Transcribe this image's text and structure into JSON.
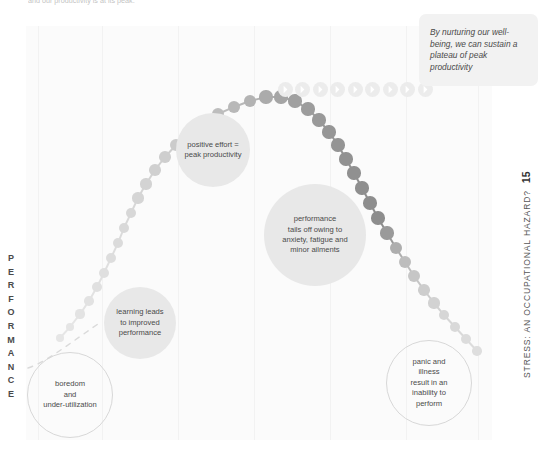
{
  "top_caption": "and our productivity is at its peak.",
  "axis": {
    "y_label": "PERFORMANCE"
  },
  "running_head": {
    "title": "STRESS: AN OCCUPATIONAL HAZARD?",
    "page_number": "15"
  },
  "callout": {
    "text": "By nurturing our well-being, we can sustain a plateau of peak productivity"
  },
  "bubbles": [
    {
      "id": "boredom",
      "lines": [
        "boredom",
        "and",
        "under-utilization"
      ],
      "style": "outlined",
      "left": 27,
      "top": 352,
      "size": 86
    },
    {
      "id": "learning",
      "lines": [
        "learning leads",
        "to improved",
        "performance"
      ],
      "style": "filled",
      "left": 104,
      "top": 287,
      "size": 72
    },
    {
      "id": "peak",
      "lines": [
        "positive effort =",
        "peak productivity"
      ],
      "style": "filled",
      "left": 176,
      "top": 113,
      "size": 74
    },
    {
      "id": "tails-off",
      "lines": [
        "performance",
        "tails off owing to",
        "anxiety, fatigue and",
        "minor ailments"
      ],
      "style": "filled",
      "left": 264,
      "top": 184,
      "size": 102
    },
    {
      "id": "panic",
      "lines": [
        "panic and",
        "illness",
        "result in an",
        "inability to",
        "perform"
      ],
      "style": "outlined",
      "left": 386,
      "top": 340,
      "size": 86
    }
  ],
  "chart_data": {
    "type": "scatter",
    "xlabel": "",
    "ylabel": "PERFORMANCE",
    "grid": false,
    "legend": null,
    "series": [
      {
        "name": "performance-curve",
        "points": [
          {
            "x": 60,
            "y": 338,
            "r": 4.0,
            "c": "#e6e6e6"
          },
          {
            "x": 70,
            "y": 327,
            "r": 4.4,
            "c": "#e5e5e5"
          },
          {
            "x": 80,
            "y": 314,
            "r": 4.6,
            "c": "#e3e3e3"
          },
          {
            "x": 89,
            "y": 301,
            "r": 4.8,
            "c": "#e2e2e2"
          },
          {
            "x": 97,
            "y": 287,
            "r": 5.0,
            "c": "#e0e0e0"
          },
          {
            "x": 104,
            "y": 273,
            "r": 5.0,
            "c": "#dfdfdf"
          },
          {
            "x": 111,
            "y": 258,
            "r": 5.2,
            "c": "#dddddd"
          },
          {
            "x": 118,
            "y": 243,
            "r": 5.2,
            "c": "#dbdbdb"
          },
          {
            "x": 124,
            "y": 228,
            "r": 5.4,
            "c": "#d9d9d9"
          },
          {
            "x": 131,
            "y": 213,
            "r": 5.4,
            "c": "#d7d7d7"
          },
          {
            "x": 138,
            "y": 198,
            "r": 5.6,
            "c": "#d5d5d5"
          },
          {
            "x": 146,
            "y": 184,
            "r": 5.6,
            "c": "#d3d3d3"
          },
          {
            "x": 155,
            "y": 170,
            "r": 5.8,
            "c": "#d0d0d0"
          },
          {
            "x": 165,
            "y": 157,
            "r": 5.8,
            "c": "#cecece"
          },
          {
            "x": 176,
            "y": 145,
            "r": 6.0,
            "c": "#cbcbcb"
          },
          {
            "x": 189,
            "y": 133,
            "r": 6.0,
            "c": "#c7c7c7"
          },
          {
            "x": 203,
            "y": 123,
            "r": 6.2,
            "c": "#c2c2c2"
          },
          {
            "x": 218,
            "y": 114,
            "r": 6.2,
            "c": "#bdbdbd"
          },
          {
            "x": 234,
            "y": 107,
            "r": 6.4,
            "c": "#b8b8b8"
          },
          {
            "x": 250,
            "y": 101,
            "r": 6.4,
            "c": "#b3b3b3"
          },
          {
            "x": 266,
            "y": 97,
            "r": 6.6,
            "c": "#ababab"
          },
          {
            "x": 281,
            "y": 97,
            "r": 6.6,
            "c": "#a5a5a5"
          },
          {
            "x": 295,
            "y": 101,
            "r": 6.6,
            "c": "#a0a0a0"
          },
          {
            "x": 308,
            "y": 109,
            "r": 6.6,
            "c": "#9c9c9c"
          },
          {
            "x": 319,
            "y": 120,
            "r": 6.6,
            "c": "#999999"
          },
          {
            "x": 329,
            "y": 132,
            "r": 6.6,
            "c": "#969696"
          },
          {
            "x": 338,
            "y": 145,
            "r": 6.6,
            "c": "#949494"
          },
          {
            "x": 346,
            "y": 159,
            "r": 6.6,
            "c": "#929292"
          },
          {
            "x": 354,
            "y": 173,
            "r": 6.6,
            "c": "#909090"
          },
          {
            "x": 362,
            "y": 188,
            "r": 6.6,
            "c": "#8f8f8f"
          },
          {
            "x": 370,
            "y": 203,
            "r": 6.8,
            "c": "#8e8e8e"
          },
          {
            "x": 378,
            "y": 218,
            "r": 6.8,
            "c": "#8d8d8d"
          },
          {
            "x": 387,
            "y": 233,
            "r": 6.6,
            "c": "#9a9a9a"
          },
          {
            "x": 396,
            "y": 248,
            "r": 6.4,
            "c": "#aeaeae"
          },
          {
            "x": 405,
            "y": 262,
            "r": 6.2,
            "c": "#bdbdbd"
          },
          {
            "x": 414,
            "y": 276,
            "r": 6.0,
            "c": "#c6c6c6"
          },
          {
            "x": 424,
            "y": 290,
            "r": 5.8,
            "c": "#cdcdcd"
          },
          {
            "x": 434,
            "y": 303,
            "r": 5.6,
            "c": "#d2d2d2"
          },
          {
            "x": 444,
            "y": 315,
            "r": 5.4,
            "c": "#d6d6d6"
          },
          {
            "x": 455,
            "y": 327,
            "r": 5.2,
            "c": "#d9d9d9"
          },
          {
            "x": 466,
            "y": 339,
            "r": 5.0,
            "c": "#dcdcdc"
          },
          {
            "x": 477,
            "y": 351,
            "r": 4.8,
            "c": "#dedede"
          }
        ]
      },
      {
        "name": "plateau-arrow-pucks",
        "icon": "chevron-right-icon",
        "y": 89,
        "count": 9,
        "x_start": 285,
        "x_step": 17.5
      }
    ]
  },
  "grid_lines_x": [
    12,
    76,
    152,
    228,
    304,
    380,
    452
  ]
}
